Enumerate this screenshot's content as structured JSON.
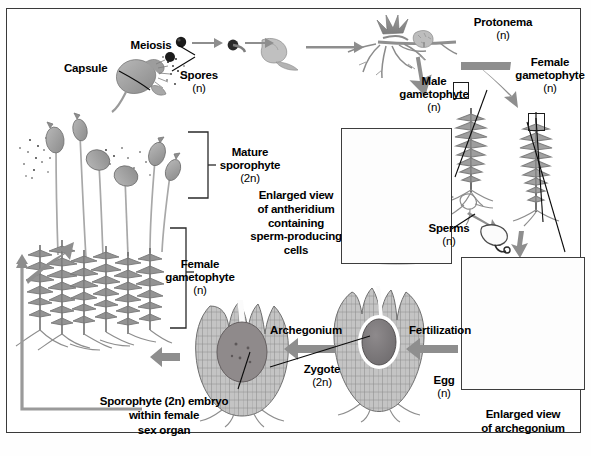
{
  "figure": {
    "background_color": "#ffffff",
    "frame_color": "#3a3a3a",
    "arrow_color": "#8e8e8e",
    "leader_line_color": "#0b0b0b",
    "illustration_tone": "grayscale"
  },
  "labels": {
    "meiosis": "Meiosis",
    "capsule": "Capsule",
    "spores": "Spores",
    "spores_ploidy": "(n)",
    "protonema": "Protonema",
    "protonema_ploidy": "(n)",
    "male_gametophyte": "Male",
    "male_gametophyte_2": "gametophyte",
    "male_gametophyte_ploidy": "(n)",
    "female_gametophyte_top": "Female",
    "female_gametophyte_top_2": "gametophyte",
    "female_gametophyte_top_ploidy": "(n)",
    "mature_sporophyte": "Mature",
    "mature_sporophyte_2": "sporophyte",
    "mature_sporophyte_ploidy": "(2n)",
    "female_gametophyte_left": "Female",
    "female_gametophyte_left_2": "gametophyte",
    "female_gametophyte_left_ploidy": "(n)",
    "antheridium_caption_1": "Enlarged view",
    "antheridium_caption_2": "of antheridium",
    "antheridium_caption_3": "containing",
    "antheridium_caption_4": "sperm-producing",
    "antheridium_caption_5": "cells",
    "sperms": "Sperms",
    "sperms_ploidy": "(n)",
    "archegonium": "Archegonium",
    "fertilization": "Fertilization",
    "zygote": "Zygote",
    "zygote_ploidy": "(2n)",
    "egg": "Egg",
    "egg_ploidy": "(n)",
    "archegonium_caption_1": "Enlarged view",
    "archegonium_caption_2": "of archegonium",
    "embryo_caption_1": "Sporophyte (2n) embryo",
    "embryo_caption_2": "within female",
    "embryo_caption_3": "sex organ"
  },
  "stages": [
    {
      "name": "capsule",
      "ploidy": "2n",
      "label": "Capsule"
    },
    {
      "name": "meiosis",
      "ploidy": "",
      "label": "Meiosis"
    },
    {
      "name": "spores",
      "ploidy": "n",
      "label": "Spores"
    },
    {
      "name": "protonema",
      "ploidy": "n",
      "label": "Protonema"
    },
    {
      "name": "male-gametophyte",
      "ploidy": "n",
      "label": "Male gametophyte"
    },
    {
      "name": "female-gametophyte",
      "ploidy": "n",
      "label": "Female gametophyte"
    },
    {
      "name": "sperms",
      "ploidy": "n",
      "label": "Sperms"
    },
    {
      "name": "egg",
      "ploidy": "n",
      "label": "Egg"
    },
    {
      "name": "fertilization",
      "ploidy": "",
      "label": "Fertilization"
    },
    {
      "name": "zygote",
      "ploidy": "2n",
      "label": "Zygote"
    },
    {
      "name": "archegonium",
      "ploidy": "",
      "label": "Archegonium"
    },
    {
      "name": "embryo",
      "ploidy": "2n",
      "label": "Sporophyte (2n) embryo within female sex organ"
    },
    {
      "name": "mature-sporophyte",
      "ploidy": "2n",
      "label": "Mature sporophyte"
    }
  ],
  "inset_boxes": [
    {
      "name": "antheridium-inset",
      "caption": "Enlarged view of antheridium containing sperm-producing cells"
    },
    {
      "name": "archegonium-inset",
      "caption": "Enlarged view of archegonium"
    }
  ]
}
